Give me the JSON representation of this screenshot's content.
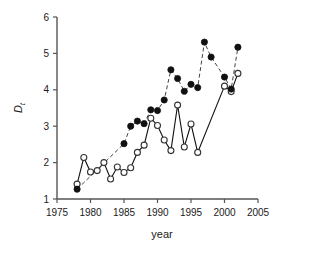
{
  "chart_data": {
    "type": "line",
    "title": "",
    "xlabel": "year",
    "ylabel": "Dt",
    "ylabel_base": "D",
    "ylabel_sub": "t",
    "xlim": [
      1975,
      2005
    ],
    "ylim": [
      1,
      6
    ],
    "xticks": [
      1975,
      1980,
      1985,
      1990,
      1995,
      2000,
      2005
    ],
    "yticks": [
      1,
      2,
      3,
      4,
      5,
      6
    ],
    "xtick_labels": [
      "1975",
      "1980",
      "1985",
      "1990",
      "1995",
      "2000",
      "2005"
    ],
    "ytick_labels": [
      "1",
      "2",
      "3",
      "4",
      "5",
      "6"
    ],
    "grid": false,
    "legend": "none",
    "series": [
      {
        "name": "filled-circles-solid-line",
        "marker": "filled-circle",
        "linestyle": "solid",
        "color": "#111111",
        "x": [
          1978,
          1985,
          1986,
          1987,
          1988,
          1989,
          1990,
          1991,
          1992,
          1993,
          1994,
          1995,
          1996,
          1997,
          1998,
          2000,
          2001,
          2002
        ],
        "values": [
          1.27,
          2.52,
          3.0,
          3.14,
          3.07,
          3.45,
          3.43,
          3.72,
          4.55,
          4.31,
          3.96,
          4.15,
          4.06,
          5.31,
          4.9,
          4.35,
          4.02,
          5.17
        ]
      },
      {
        "name": "open-circles-dashed-line",
        "marker": "open-circle",
        "linestyle": "dashed",
        "color": "#333333",
        "x": [
          1978,
          1979,
          1980,
          1981,
          1982,
          1983,
          1984,
          1985,
          1986,
          1987,
          1988,
          1989,
          1990,
          1991,
          1992,
          1993,
          1994,
          1995,
          1996,
          2000,
          2001,
          2002
        ],
        "values": [
          1.41,
          2.14,
          1.74,
          1.78,
          2.0,
          1.55,
          1.88,
          1.73,
          1.86,
          2.28,
          2.48,
          3.22,
          3.02,
          2.62,
          2.33,
          3.58,
          2.43,
          3.06,
          2.28,
          4.1,
          3.95,
          4.45
        ]
      }
    ]
  },
  "axes": {
    "x_axis_name": "year-axis",
    "y_axis_name": "dt-axis"
  }
}
